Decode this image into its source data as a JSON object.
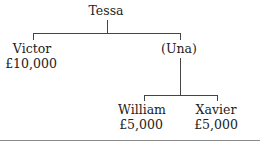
{
  "diagram": {
    "type": "family-tree",
    "nodes": {
      "root": {
        "name": "Tessa"
      },
      "victor": {
        "name": "Victor",
        "amount": "£10,000"
      },
      "una": {
        "name": "(Una)"
      },
      "william": {
        "name": "William",
        "amount": "£5,000"
      },
      "xavier": {
        "name": "Xavier",
        "amount": "£5,000"
      }
    },
    "edges": [
      [
        "Tessa",
        "Victor"
      ],
      [
        "Tessa",
        "(Una)"
      ],
      [
        "(Una)",
        "William"
      ],
      [
        "(Una)",
        "Xavier"
      ]
    ],
    "line_color": "#444444",
    "rule_color": "#8a8a8a"
  }
}
